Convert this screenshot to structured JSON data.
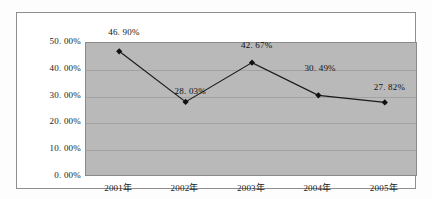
{
  "chart_data": {
    "type": "line",
    "title": "",
    "xlabel": "",
    "ylabel": "",
    "categories": [
      "2001年",
      "2002年",
      "2003年",
      "2004年",
      "2005年"
    ],
    "values": [
      46.9,
      28.03,
      42.67,
      30.49,
      27.82
    ],
    "data_labels": [
      "46. 90%",
      "28. 03%",
      "42. 67%",
      "30. 49%",
      "27. 82%"
    ],
    "ylim": [
      0,
      50
    ],
    "ytick_values": [
      0,
      10,
      20,
      30,
      40,
      50
    ],
    "ytick_labels": [
      "0. 00%",
      "10. 00%",
      "20. 00%",
      "30. 00%",
      "40. 00%",
      "50. 00%"
    ],
    "grid": true,
    "legend": "none",
    "marker": "diamond",
    "series": [
      {
        "name": "",
        "values": [
          46.9,
          28.03,
          42.67,
          30.49,
          27.82
        ]
      }
    ],
    "colors": {
      "plot_background": "#b9b9b9",
      "gridline": "#a2a2a2",
      "series_line": "#1a1a1a",
      "marker": "#111111",
      "frame": "#8e8e8e",
      "text": "#1a1a1a"
    },
    "label_offsets": [
      {
        "dx": 7,
        "dy": -4
      },
      {
        "dx": 7,
        "dy": 4
      },
      {
        "dx": 7,
        "dy": -3
      },
      {
        "dx": 4,
        "dy": -12
      },
      {
        "dx": 7,
        "dy": 0
      }
    ]
  }
}
